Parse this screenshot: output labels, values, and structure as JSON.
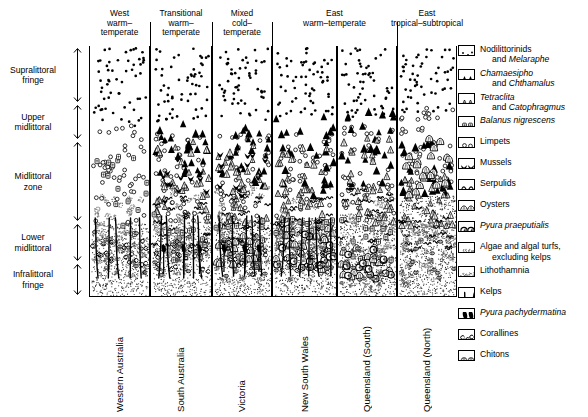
{
  "figure": {
    "type": "zonation-profile-diagram"
  },
  "zones": [
    {
      "name": "Supralittoral fringe",
      "lines": [
        "Supralittoral",
        "fringe"
      ],
      "top": 47,
      "bottom": 103
    },
    {
      "name": "Upper midlittoral",
      "lines": [
        "Upper",
        "midlittoral"
      ],
      "top": 104,
      "bottom": 140
    },
    {
      "name": "Midlittoral zone",
      "lines": [
        "Midlittoral",
        "zone"
      ],
      "top": 141,
      "bottom": 222
    },
    {
      "name": "Lower midlittoral",
      "lines": [
        "Lower",
        "midlittoral"
      ],
      "top": 223,
      "bottom": 262
    },
    {
      "name": "Infralittoral fringe",
      "lines": [
        "Infralittoral",
        "fringe"
      ],
      "top": 263,
      "bottom": 296
    }
  ],
  "headers": [
    {
      "lines": [
        "West",
        "warm–",
        "temperate"
      ],
      "left": 0,
      "width": 61
    },
    {
      "lines": [
        "Transitional",
        "warm–",
        "temperate"
      ],
      "left": 61,
      "width": 62
    },
    {
      "lines": [
        "Mixed",
        "cold–",
        "temperate"
      ],
      "left": 123,
      "width": 60
    },
    {
      "lines": [
        "East",
        "warm–temperate"
      ],
      "left": 183,
      "width": 125
    },
    {
      "lines": [
        "East",
        "tropical–subtropical"
      ],
      "left": 308,
      "width": 60
    }
  ],
  "columns": [
    {
      "label": "Western Australia",
      "left": 0,
      "width": 61
    },
    {
      "label": "South Australia",
      "left": 61,
      "width": 62
    },
    {
      "label": "Victoria",
      "left": 123,
      "width": 60
    },
    {
      "label": "New South Wales",
      "left": 183,
      "width": 65
    },
    {
      "label": "Queensland (South)",
      "left": 248,
      "width": 60
    },
    {
      "label": "Queensland (North)",
      "left": 308,
      "width": 60
    }
  ],
  "legend": [
    {
      "icon": "nodilittorinids-icon",
      "lines": [
        "Nodilittorinids"
      ],
      "indented": [
        "and ",
        "Melaraphe"
      ],
      "italic_tail": true
    },
    {
      "icon": "chamaesipho-icon",
      "lines": [
        "Chamaesipho"
      ],
      "indented": [
        "and ",
        "Chthamalus"
      ],
      "italic_head": true,
      "italic_tail": true
    },
    {
      "icon": "tetraclita-icon",
      "lines": [
        "Tetraclita"
      ],
      "indented": [
        "and ",
        "Catophragmus"
      ],
      "italic_head": true,
      "italic_tail": true
    },
    {
      "icon": "balanus-icon",
      "lines": [
        "Balanus nigrescens"
      ],
      "italic_head": true
    },
    {
      "icon": "limpets-icon",
      "lines": [
        "Limpets"
      ]
    },
    {
      "icon": "mussels-icon",
      "lines": [
        "Mussels"
      ]
    },
    {
      "icon": "serpulids-icon",
      "lines": [
        "Serpulids"
      ]
    },
    {
      "icon": "oysters-icon",
      "lines": [
        "Oysters"
      ]
    },
    {
      "icon": "pyura-praeputialis-icon",
      "lines": [
        "Pyura praeputialis"
      ],
      "italic_head": true
    },
    {
      "icon": "algae-icon",
      "lines": [
        "Algae and algal turfs,"
      ],
      "indented_plain": "excluding kelps"
    },
    {
      "icon": "lithothamnia-icon",
      "lines": [
        "Lithothamnia"
      ]
    },
    {
      "icon": "kelps-icon",
      "lines": [
        "Kelps"
      ]
    },
    {
      "icon": "pyura-pachydermatina-icon",
      "lines": [
        "Pyura pachydermatina"
      ],
      "italic_head": true
    },
    {
      "icon": "corallines-icon",
      "lines": [
        "Corallines"
      ]
    },
    {
      "icon": "chitons-icon",
      "lines": [
        "Chitons"
      ]
    }
  ],
  "chart_data": {
    "type": "heatmap",
    "xlabel": "Region",
    "ylabel": "Shore zone",
    "categories": [
      "Western Australia",
      "South Australia",
      "Victoria",
      "New South Wales",
      "Queensland (South)",
      "Queensland (North)"
    ],
    "row_categories": [
      "Supralittoral fringe",
      "Upper midlittoral",
      "Midlittoral zone",
      "Lower midlittoral",
      "Infralittoral fringe"
    ],
    "legend_position": "right",
    "grid": false,
    "series": [
      {
        "name": "Nodilittorinids and Melaraphe",
        "values": [
          1,
          1,
          1,
          1,
          1,
          1
        ]
      },
      {
        "name": "Chamaesipho and Chthamalus",
        "values": [
          0,
          1,
          1,
          1,
          1,
          1
        ]
      },
      {
        "name": "Tetraclita and Catophragmus",
        "values": [
          0,
          1,
          1,
          1,
          1,
          1
        ]
      },
      {
        "name": "Balanus nigrescens",
        "values": [
          1,
          1,
          1,
          1,
          0,
          0
        ]
      },
      {
        "name": "Limpets",
        "values": [
          1,
          1,
          1,
          1,
          1,
          1
        ]
      },
      {
        "name": "Mussels",
        "values": [
          0,
          1,
          1,
          1,
          0,
          0
        ]
      },
      {
        "name": "Serpulids",
        "values": [
          0,
          1,
          1,
          1,
          1,
          1
        ]
      },
      {
        "name": "Oysters",
        "values": [
          0,
          0,
          0,
          1,
          1,
          1
        ]
      },
      {
        "name": "Pyura praeputialis",
        "values": [
          0,
          0,
          0,
          1,
          1,
          0
        ]
      },
      {
        "name": "Algae and algal turfs, excluding kelps",
        "values": [
          1,
          1,
          1,
          1,
          1,
          1
        ]
      },
      {
        "name": "Lithothamnia",
        "values": [
          1,
          1,
          1,
          1,
          1,
          1
        ]
      },
      {
        "name": "Kelps",
        "values": [
          1,
          1,
          1,
          1,
          0,
          0
        ]
      },
      {
        "name": "Pyura pachydermatina",
        "values": [
          0,
          1,
          1,
          0,
          0,
          0
        ]
      },
      {
        "name": "Corallines",
        "values": [
          1,
          1,
          1,
          1,
          0,
          0
        ]
      },
      {
        "name": "Chitons",
        "values": [
          1,
          1,
          1,
          1,
          1,
          1
        ]
      }
    ]
  }
}
